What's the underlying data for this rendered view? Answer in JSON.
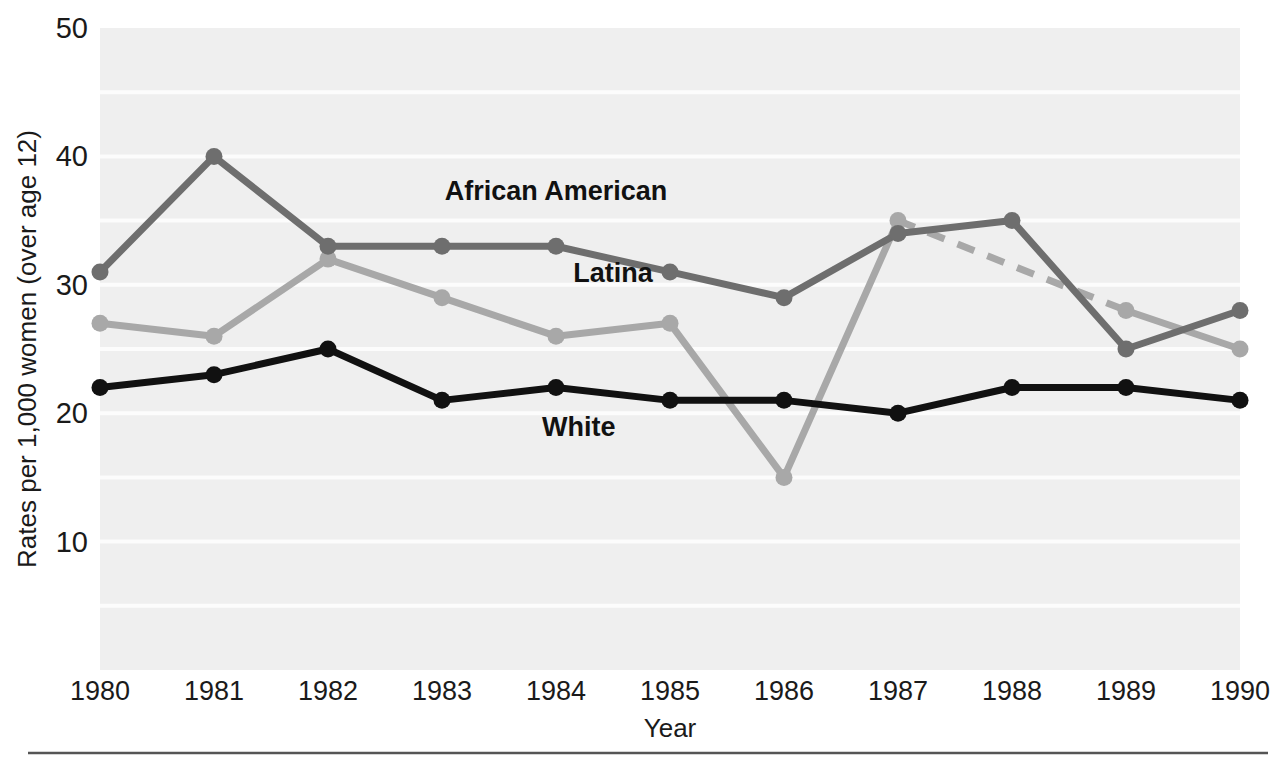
{
  "chart_data": {
    "type": "line",
    "title": "",
    "subtitle": "",
    "xlabel": "Year",
    "ylabel": "Rates per 1,000 women (over age 12)",
    "x": [
      1980,
      1981,
      1982,
      1983,
      1984,
      1985,
      1986,
      1987,
      1988,
      1989,
      1990
    ],
    "xticklabels": [
      "1980",
      "1981",
      "1982",
      "1983",
      "1984",
      "1985",
      "1986",
      "1987",
      "1988",
      "1989",
      "1990"
    ],
    "yticklabels": [
      "50",
      "40",
      "30",
      "20",
      "10"
    ],
    "ytickvalues": [
      50,
      40,
      30,
      20,
      10
    ],
    "ylim": [
      0,
      50
    ],
    "xlim": [
      1980,
      1990
    ],
    "grid": "horizontal-white-bands-every-5-units",
    "legend": "inline-annotations",
    "plot_background": "#efefef",
    "series": [
      {
        "name": "African American",
        "color": "#6e6e6e",
        "style": "solid",
        "marker": "circle",
        "values": [
          31,
          40,
          33,
          33,
          33,
          31,
          29,
          34,
          35,
          25,
          28
        ],
        "annotation": {
          "label": "African American",
          "x_value": 1984,
          "y_value": 36.6
        }
      },
      {
        "name": "Latina",
        "color": "#a8a8a8",
        "style": "solid",
        "marker": "circle",
        "values": [
          27,
          26,
          32,
          29,
          26,
          27,
          15,
          35,
          null,
          28,
          25
        ],
        "annotation": {
          "label": "Latina",
          "x_value": 1984.5,
          "y_value": 30.2
        },
        "dashed_segment": {
          "style": "dashed",
          "from": {
            "x_value": 1987,
            "y_value": 35
          },
          "to": {
            "x_value": 1989,
            "y_value": 28
          }
        }
      },
      {
        "name": "White",
        "color": "#111111",
        "style": "solid",
        "marker": "circle",
        "values": [
          22,
          23,
          25,
          21,
          22,
          21,
          21,
          20,
          22,
          22,
          21
        ],
        "annotation": {
          "label": "White",
          "x_value": 1984.2,
          "y_value": 18.2
        }
      }
    ],
    "footer_rule": true
  }
}
